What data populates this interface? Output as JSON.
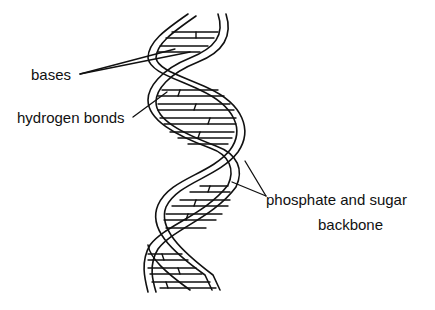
{
  "diagram": {
    "labels": {
      "bases": "bases",
      "hydrogen_bonds": "hydrogen bonds",
      "backbone_line1": "phosphate and sugar",
      "backbone_line2": "backbone"
    },
    "colors": {
      "stroke": "#111111",
      "background": "#ffffff"
    }
  }
}
